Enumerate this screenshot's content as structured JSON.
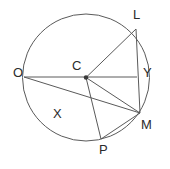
{
  "figure": {
    "kind": "circle-geometry-diagram",
    "background_color": "#ffffff",
    "stroke_color": "#5a5a5a",
    "label_color": "#2b2b2b",
    "width": 170,
    "height": 169
  },
  "circle": {
    "name": "main-circle",
    "center_label": "C",
    "cx": 86,
    "cy": 77.5,
    "r": 63.5
  },
  "points": [
    {
      "id": "L",
      "label": "L",
      "x": 136,
      "y": 29,
      "label_x": 133,
      "label_y": 8,
      "on_circle": true
    },
    {
      "id": "Y",
      "label": "Y",
      "x": 137,
      "y": 77,
      "label_x": 143,
      "label_y": 66,
      "on_circle": false
    },
    {
      "id": "M",
      "label": "M",
      "x": 140,
      "y": 113,
      "label_x": 141,
      "label_y": 118,
      "on_circle": true
    },
    {
      "id": "P",
      "label": "P",
      "x": 101,
      "y": 139,
      "label_x": 99,
      "label_y": 143,
      "on_circle": true
    },
    {
      "id": "X",
      "label": "X",
      "x": 62,
      "y": 104,
      "label_x": 53,
      "label_y": 107,
      "on_circle": false
    },
    {
      "id": "O",
      "label": "O",
      "x": 24,
      "y": 77,
      "label_x": 13,
      "label_y": 66,
      "on_circle": true
    },
    {
      "id": "C",
      "label": "C",
      "x": 86,
      "y": 77.5,
      "label_x": 72,
      "label_y": 59,
      "on_circle": false
    }
  ],
  "segments": [
    {
      "name": "segment-O-Y",
      "from": "O",
      "to": "Y"
    },
    {
      "name": "segment-O-M",
      "from": "O",
      "to": "M"
    },
    {
      "name": "segment-C-L",
      "from": "C",
      "to": "L"
    },
    {
      "name": "segment-L-M",
      "from": "L",
      "to": "M"
    },
    {
      "name": "segment-C-M",
      "from": "C",
      "to": "M"
    },
    {
      "name": "segment-C-P",
      "from": "C",
      "to": "P"
    },
    {
      "name": "segment-P-M",
      "from": "P",
      "to": "M"
    }
  ],
  "center_dot": {
    "name": "center-point-C",
    "x": 86,
    "y": 77.5,
    "r": 2.2
  }
}
